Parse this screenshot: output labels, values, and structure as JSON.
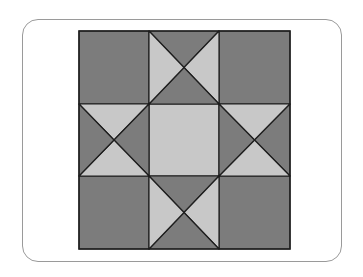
{
  "diagram": {
    "type": "quilt-block",
    "pattern": "Ohio Star",
    "grid": "3x3",
    "colors": {
      "dark": "#7c7c7c",
      "light": "#c8c8c8",
      "line": "#1e1e1e",
      "frame": "#9a9a9a"
    },
    "corner_blocks": [
      {
        "position": "top-left",
        "fill": "dark"
      },
      {
        "position": "top-right",
        "fill": "dark"
      },
      {
        "position": "bottom-left",
        "fill": "dark"
      },
      {
        "position": "bottom-right",
        "fill": "dark"
      }
    ],
    "center_block": {
      "position": "center",
      "fill": "light"
    },
    "star_point_blocks": [
      {
        "position": "top-middle",
        "triangles": {
          "top": "dark",
          "right": "light",
          "bottom": "dark",
          "left": "light"
        }
      },
      {
        "position": "middle-left",
        "triangles": {
          "top": "light",
          "right": "dark",
          "bottom": "light",
          "left": "dark"
        }
      },
      {
        "position": "middle-right",
        "triangles": {
          "top": "light",
          "right": "dark",
          "bottom": "light",
          "left": "dark"
        }
      },
      {
        "position": "bottom-middle",
        "triangles": {
          "top": "dark",
          "right": "light",
          "bottom": "dark",
          "left": "light"
        }
      }
    ]
  }
}
